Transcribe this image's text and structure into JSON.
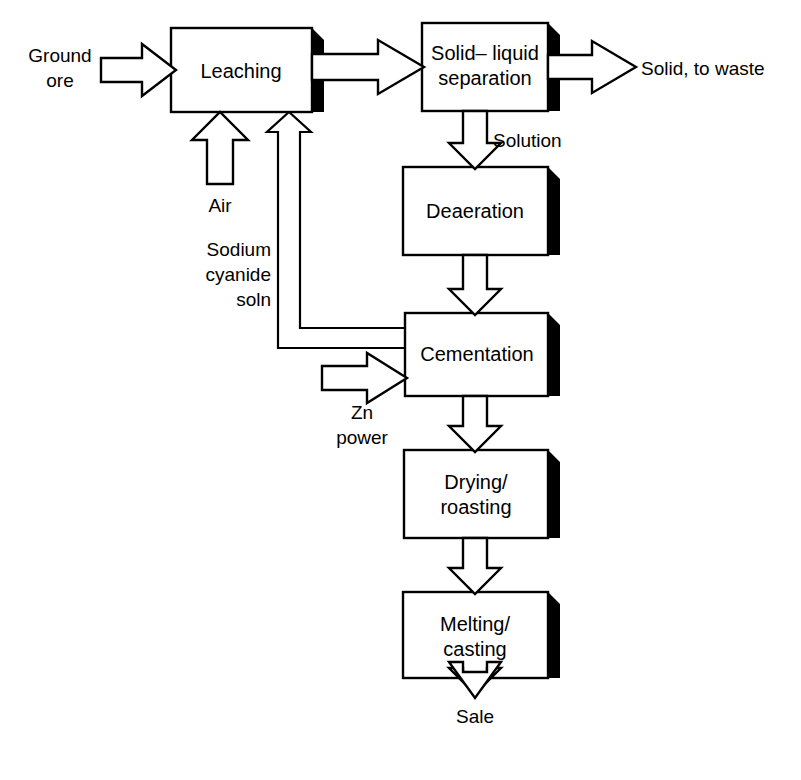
{
  "diagram": {
    "type": "process-flow-diagram",
    "colors": {
      "background": "#ffffff",
      "stroke": "#000000",
      "box_fill": "#ffffff",
      "shadow": "#000000"
    },
    "boxes": [
      {
        "id": "leaching",
        "label": "Leaching",
        "lines": [
          "Leaching"
        ],
        "x": 171,
        "y": 28,
        "w": 141,
        "h": 84
      },
      {
        "id": "separation",
        "label": "Solid– liquid separation",
        "lines": [
          "Solid– liquid",
          "separation"
        ],
        "x": 422,
        "y": 23,
        "w": 126,
        "h": 88
      },
      {
        "id": "deaeration",
        "label": "Deaeration",
        "lines": [
          "Deaeration"
        ],
        "x": 403,
        "y": 167,
        "w": 145,
        "h": 88
      },
      {
        "id": "cementation",
        "label": "Cementation",
        "lines": [
          "Cementation"
        ],
        "x": 405,
        "y": 313,
        "w": 143,
        "h": 83
      },
      {
        "id": "drying",
        "label": "Drying/ roasting",
        "lines": [
          "Drying/",
          "roasting"
        ],
        "x": 404,
        "y": 450,
        "w": 144,
        "h": 88
      },
      {
        "id": "melting",
        "label": "Melting/ casting",
        "lines": [
          "Melting/",
          "casting"
        ],
        "x": 403,
        "y": 592,
        "w": 145,
        "h": 86
      }
    ],
    "stream_labels": [
      {
        "id": "ground-ore",
        "lines": [
          "Ground",
          "ore"
        ],
        "x": 60,
        "y": 62,
        "align": "center"
      },
      {
        "id": "air",
        "lines": [
          "Air"
        ],
        "x": 220,
        "y": 212,
        "align": "center"
      },
      {
        "id": "sodium-cyanide",
        "lines": [
          "Sodium",
          "cyanide",
          "soln"
        ],
        "x": 271,
        "y": 256,
        "align": "right"
      },
      {
        "id": "zn-power",
        "lines": [
          "Zn",
          "power"
        ],
        "x": 362,
        "y": 412,
        "align": "center"
      },
      {
        "id": "solid-to-waste",
        "lines": [
          "Solid, to waste"
        ],
        "x": 641,
        "y": 75,
        "align": "left"
      },
      {
        "id": "solution",
        "lines": [
          "Solution"
        ],
        "x": 493,
        "y": 147,
        "align": "left"
      },
      {
        "id": "sale",
        "lines": [
          "Sale"
        ],
        "x": 475,
        "y": 716,
        "align": "center"
      }
    ],
    "flows": [
      {
        "id": "ore-to-leaching",
        "from": "Ground ore",
        "to": "Leaching",
        "direction": "right"
      },
      {
        "id": "leaching-to-separation",
        "from": "Leaching",
        "to": "Solid– liquid separation",
        "direction": "right"
      },
      {
        "id": "separation-to-waste",
        "from": "Solid– liquid separation",
        "to": "Solid, to waste",
        "direction": "right"
      },
      {
        "id": "separation-to-deaeration",
        "from": "Solid– liquid separation",
        "to": "Deaeration",
        "direction": "down",
        "label": "Solution"
      },
      {
        "id": "air-to-leaching",
        "from": "Air",
        "to": "Leaching",
        "direction": "up"
      },
      {
        "id": "deaeration-to-cementation",
        "from": "Deaeration",
        "to": "Cementation",
        "direction": "down"
      },
      {
        "id": "zn-to-cementation",
        "from": "Zn power",
        "to": "Cementation",
        "direction": "right"
      },
      {
        "id": "cementation-recycle",
        "from": "Cementation",
        "to": "Leaching",
        "direction": "recycle",
        "label": "Sodium cyanide soln"
      },
      {
        "id": "cementation-to-drying",
        "from": "Cementation",
        "to": "Drying/ roasting",
        "direction": "down"
      },
      {
        "id": "drying-to-melting",
        "from": "Drying/ roasting",
        "to": "Melting/ casting",
        "direction": "down"
      },
      {
        "id": "melting-to-sale",
        "from": "Melting/ casting",
        "to": "Sale",
        "direction": "down"
      }
    ]
  }
}
